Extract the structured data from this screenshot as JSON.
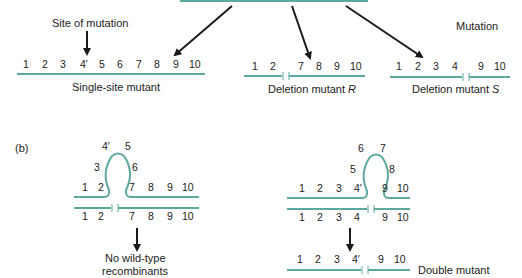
{
  "colors": {
    "dna": "#5fa8a0",
    "arrow": "#1a1a1a",
    "text": "#222222"
  },
  "panel_a": {
    "site_label": "Site of mutation",
    "mutation_label": "Mutation",
    "single_site": {
      "numbers": [
        "1",
        "2",
        "3",
        "4′",
        "5",
        "6",
        "7",
        "8",
        "9",
        "10"
      ],
      "label": "Single-site mutant"
    },
    "deletion_r": {
      "numbers": [
        "1",
        "2",
        "7",
        "8",
        "9",
        "10"
      ],
      "label_prefix": "Deletion mutant ",
      "label_italic": "R"
    },
    "deletion_s": {
      "numbers": [
        "1",
        "2",
        "3",
        "4",
        "9",
        "10"
      ],
      "label_prefix": "Deletion mutant ",
      "label_italic": "S"
    }
  },
  "panel_b": {
    "label": "(b)",
    "left": {
      "loop_numbers": [
        "3",
        "4′",
        "5",
        "6"
      ],
      "top_numbers": [
        "1",
        "2",
        "7",
        "8",
        "9",
        "10"
      ],
      "bottom_numbers": [
        "1",
        "2",
        "7",
        "8",
        "9",
        "10"
      ],
      "result_line1": "No wild-type",
      "result_line2": "recombinants"
    },
    "right": {
      "loop_numbers": [
        "5",
        "6",
        "7",
        "8"
      ],
      "top_numbers": [
        "1",
        "2",
        "3",
        "4′",
        "9",
        "10"
      ],
      "bottom_numbers": [
        "1",
        "2",
        "3",
        "4",
        "9",
        "10"
      ],
      "result_numbers": [
        "1",
        "2",
        "3",
        "4′",
        "9",
        "10"
      ],
      "result_label": "Double mutant"
    }
  }
}
